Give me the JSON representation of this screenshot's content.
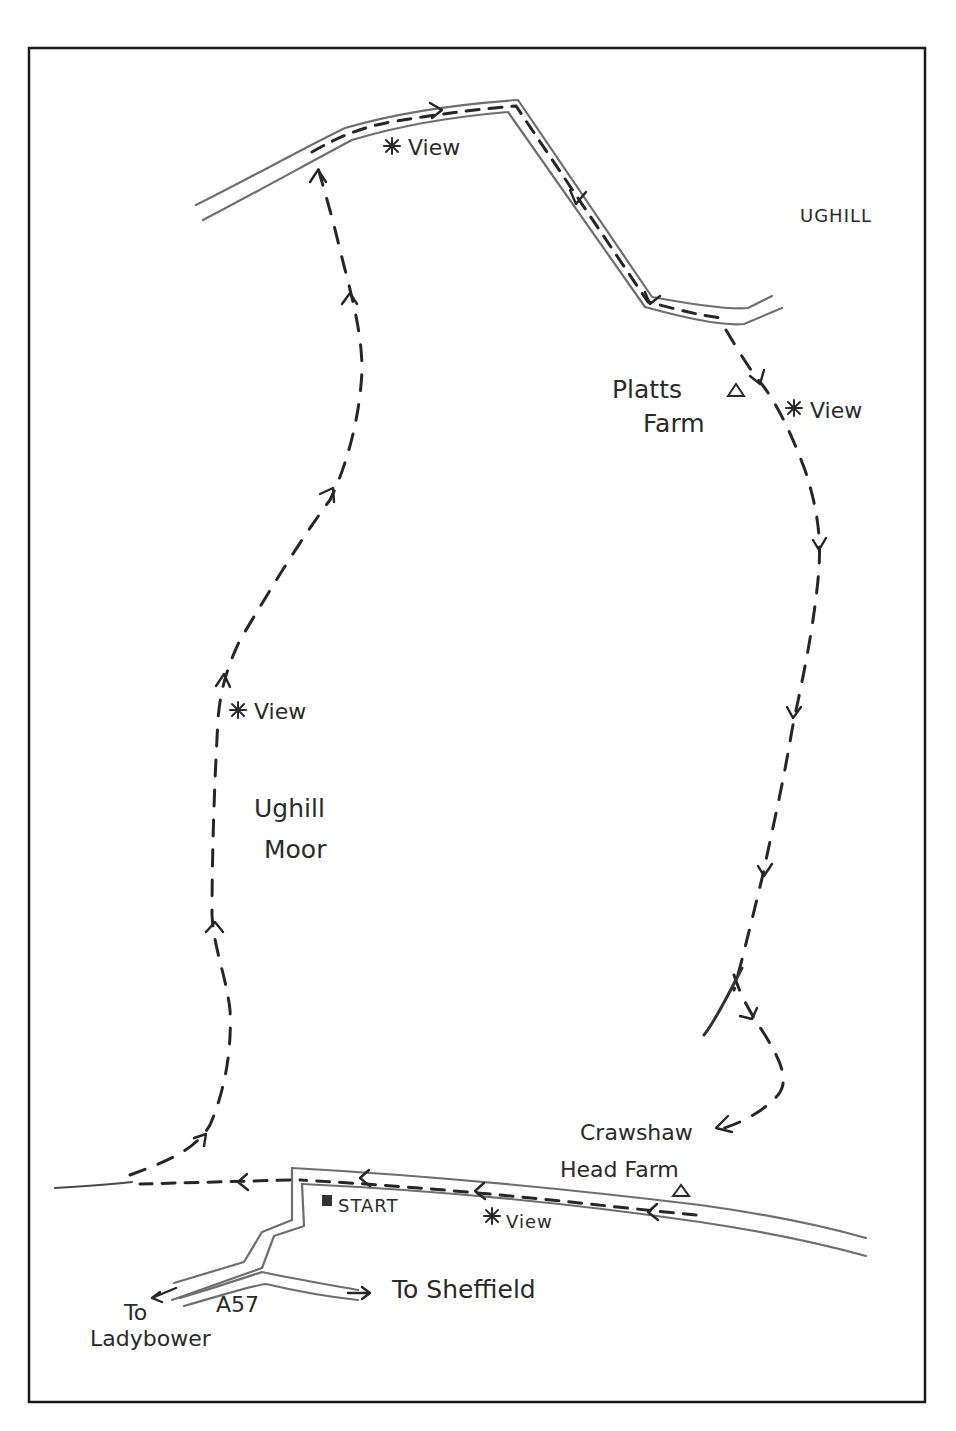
{
  "map": {
    "type": "hand-drawn walking route map",
    "region_label": "UGHILL",
    "area_label": [
      "Ughill",
      "Moor"
    ],
    "farms": [
      {
        "name": [
          "Platts",
          "Farm"
        ],
        "icon": "triangle-farm-icon"
      },
      {
        "name": [
          "Crawshaw",
          "Head Farm"
        ],
        "icon": "triangle-farm-icon"
      }
    ],
    "viewpoints": [
      {
        "label": "View",
        "icon": "asterisk-view-icon",
        "location": "top road"
      },
      {
        "label": "View",
        "icon": "asterisk-view-icon",
        "location": "below Platts Farm"
      },
      {
        "label": "View",
        "icon": "asterisk-view-icon",
        "location": "west trail"
      },
      {
        "label": "View",
        "icon": "asterisk-view-icon",
        "location": "bottom road"
      }
    ],
    "start": {
      "label": "START",
      "icon": "square-start-icon"
    },
    "roads": {
      "a57_label": "A57",
      "to_sheffield": "To Sheffield",
      "to_ladybower": [
        "To",
        "Ladybower"
      ]
    },
    "route_direction": "clockwise loop: start west along road, north across Ughill Moor, east along top road, south past Platts Farm to Crawshaw Head Farm, west back to start"
  }
}
